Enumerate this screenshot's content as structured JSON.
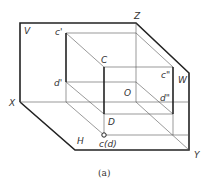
{
  "diagram": {
    "type": "three-plane projection",
    "caption": "(a)",
    "planes": {
      "V": "V",
      "H": "H",
      "W": "W"
    },
    "axes": {
      "X": "X",
      "Y": "Y",
      "Z": "Z",
      "origin": "O"
    },
    "points": {
      "C": "C",
      "D": "D",
      "c_prime": "c'",
      "d_prime": "d'",
      "c_double_prime": "c\"",
      "d_double_prime": "d\"",
      "cd_horizontal": "c(d)"
    }
  }
}
